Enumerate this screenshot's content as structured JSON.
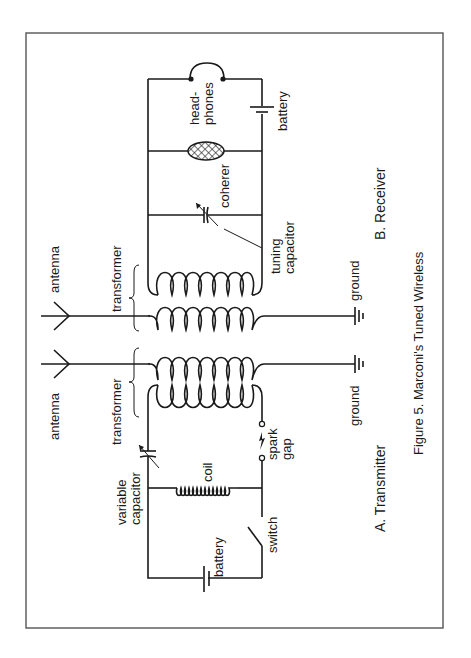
{
  "figure": {
    "caption": "Figure 5.  Marconi's Tuned Wireless",
    "border_color": "#555555",
    "line_color": "#1a1a1a"
  },
  "receiver": {
    "section_label": "B.  Receiver",
    "labels": {
      "antenna": "antenna",
      "transformer": "transformer",
      "headphones_1": "head-",
      "headphones_2": "phones",
      "battery": "battery",
      "coherer": "coherer",
      "tuning_1": "tuning",
      "tuning_2": "capacitor",
      "ground": "ground"
    }
  },
  "transmitter": {
    "section_label": "A.  Transmitter",
    "labels": {
      "antenna": "antenna",
      "transformer": "transformer",
      "variable_1": "variable",
      "variable_2": "capacitor",
      "coil": "coil",
      "spark_1": "spark",
      "spark_2": "gap",
      "switch": "switch",
      "battery": "battery",
      "ground": "ground"
    }
  }
}
